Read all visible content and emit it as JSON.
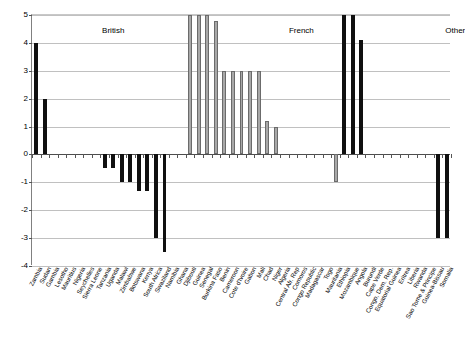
{
  "chart_data": {
    "type": "bar",
    "title": "",
    "xlabel": "",
    "ylabel": "",
    "ylim": [
      -4,
      5
    ],
    "yticks": [
      5,
      4,
      3,
      2,
      1,
      0,
      -1,
      -2,
      -3,
      -4
    ],
    "grid": true,
    "legend": null,
    "group_annotations": [
      {
        "label": "British",
        "center_index": 9
      },
      {
        "label": "French",
        "center_index": 31
      },
      {
        "label": "Other",
        "center_index": 49
      }
    ],
    "series_colors": {
      "black": "#101010",
      "gray": "#a8a8a8"
    },
    "categories": [
      "Zambia",
      "Sudan",
      "Gambia",
      "Lesotho",
      "Mauritius",
      "Nigeria",
      "Seychelles",
      "Sierra Leone",
      "Tanzania",
      "Uganda",
      "Malawi",
      "Zimbabwe",
      "Botswana",
      "Kenya",
      "South Africa",
      "Swaziland",
      "Namibia",
      "Ghana",
      "Djibouti",
      "Guinea",
      "Senegal",
      "Burkina Faso",
      "Benin",
      "Cameroon",
      "Cote d'Ivoire",
      "Gabon",
      "Mali",
      "Chad",
      "Niger",
      "Algeria",
      "Central Afr. Rep",
      "Comoros",
      "Congo Republic",
      "Madagascar",
      "Togo",
      "Mauritania",
      "Ethiopia",
      "Mozambique",
      "Angola",
      "Burundi",
      "Cape Verde",
      "Congo, Dem. Rep.",
      "Equatorial Guinea",
      "Eritrea",
      "Liberia",
      "Rwanda",
      "Sao Tome & Principe",
      "Guinea-Bissau",
      "Somalia"
    ],
    "values": [
      4,
      2,
      0,
      0,
      0,
      0,
      0,
      0,
      -0.5,
      -0.5,
      -1,
      -1,
      -1.3,
      -1.3,
      -3,
      -3.5,
      0,
      0,
      5,
      5,
      5,
      4.8,
      3,
      3,
      3,
      3,
      3,
      1.2,
      1,
      0,
      0,
      0,
      0,
      0,
      0,
      -1,
      5,
      5,
      4.1,
      0,
      0,
      0,
      0,
      0,
      0,
      0,
      0,
      -3,
      -3
    ],
    "colors": [
      "black",
      "black",
      "black",
      "black",
      "black",
      "black",
      "black",
      "black",
      "black",
      "black",
      "black",
      "black",
      "black",
      "black",
      "black",
      "black",
      "black",
      "black",
      "gray",
      "gray",
      "gray",
      "gray",
      "gray",
      "gray",
      "gray",
      "gray",
      "gray",
      "gray",
      "gray",
      "gray",
      "gray",
      "gray",
      "gray",
      "gray",
      "gray",
      "gray",
      "black",
      "black",
      "black",
      "black",
      "black",
      "black",
      "black",
      "black",
      "black",
      "black",
      "black",
      "black",
      "black"
    ]
  }
}
